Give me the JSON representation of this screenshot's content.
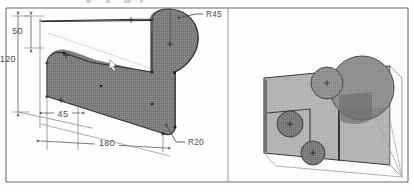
{
  "drawing": {
    "title_strip_visible": true,
    "background_color": "#fdfdfc",
    "frame_color": "#6d6d6d",
    "part_fill_color": "#808080",
    "part_outline_color": "#2b2b2b",
    "dim_line_color": "#5a5a5a",
    "iso_face_color": "#b3b3b3",
    "iso_shadow_color": "#7a7a7a",
    "iso_circle_color": "#8f8f8f"
  },
  "orthographic_view": {
    "name": "front-profile-view",
    "dimensions": [
      {
        "id": "height-upper",
        "label": "50",
        "kind": "linear-vertical"
      },
      {
        "id": "height-overall",
        "label": "120",
        "kind": "linear-vertical"
      },
      {
        "id": "width-left-offset",
        "label": "45",
        "kind": "linear-horizontal"
      },
      {
        "id": "width-overall",
        "label": "180",
        "kind": "linear-horizontal"
      }
    ],
    "radii": [
      {
        "id": "radius-large-end",
        "label": "R45",
        "kind": "radius-leader"
      },
      {
        "id": "radius-bottom-corner",
        "label": "R20",
        "kind": "radius-leader"
      }
    ]
  },
  "isometric_view": {
    "name": "isometric-solid-view",
    "features": [
      {
        "id": "iso-circle-top-small",
        "kind": "circle-with-center-mark"
      },
      {
        "id": "iso-circle-top-large",
        "kind": "circle-with-center-mark"
      },
      {
        "id": "iso-circle-inner-upper",
        "kind": "circle-with-center-mark"
      },
      {
        "id": "iso-circle-inner-lower",
        "kind": "circle-with-center-mark"
      },
      {
        "id": "iso-notch",
        "kind": "l-shaped-notch"
      }
    ]
  }
}
